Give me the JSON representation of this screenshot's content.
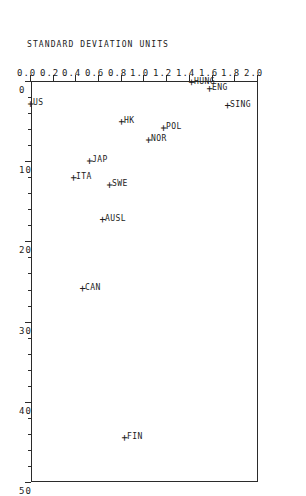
{
  "chart_data": {
    "type": "scatter",
    "title": "",
    "subtitle": "",
    "xlabel": "",
    "ylabel": "STANDARD DEVIATION UNITS",
    "xlim": [
      0,
      50
    ],
    "ylim": [
      0.0,
      2.0
    ],
    "grid": false,
    "legend": "none",
    "orientation": "rotated-90-clockwise",
    "marker": "+",
    "x_ticks": [
      0,
      10,
      20,
      30,
      40,
      50
    ],
    "x_tick_labels": [
      "0",
      "10",
      "20",
      "30",
      "40",
      "50"
    ],
    "x_minor_tick_step": 2,
    "y_ticks": [
      0.0,
      0.2,
      0.4,
      0.6,
      0.8,
      1.0,
      1.2,
      1.4,
      1.6,
      1.8,
      2.0
    ],
    "y_tick_labels": [
      "0.0",
      "0.2",
      "0.4",
      "0.6",
      "0.8",
      "1.0",
      "1.2",
      "1.4",
      "1.6",
      "1.8",
      "2.0"
    ],
    "points": [
      {
        "label": "FIN",
        "x": 44.5,
        "y": 0.83,
        "label_pos": "left"
      },
      {
        "label": "CAN",
        "x": 25.9,
        "y": 0.46,
        "label_pos": "left"
      },
      {
        "label": "AUSL",
        "x": 17.3,
        "y": 0.63,
        "label_pos": "left"
      },
      {
        "label": "SWE",
        "x": 13.0,
        "y": 0.7,
        "label_pos": "left"
      },
      {
        "label": "ITA",
        "x": 12.1,
        "y": 0.38,
        "label_pos": "left"
      },
      {
        "label": "JAP",
        "x": 10.0,
        "y": 0.52,
        "label_pos": "left"
      },
      {
        "label": "NOR",
        "x": 7.4,
        "y": 1.04,
        "label_pos": "left"
      },
      {
        "label": "POL",
        "x": 5.9,
        "y": 1.17,
        "label_pos": "left"
      },
      {
        "label": "HK",
        "x": 5.1,
        "y": 0.8,
        "label_pos": "left"
      },
      {
        "label": "SING",
        "x": 3.1,
        "y": 1.74,
        "label_pos": "left"
      },
      {
        "label": "US",
        "x": 2.9,
        "y": 0.0,
        "label_pos": "left"
      },
      {
        "label": "ENG",
        "x": 1.0,
        "y": 1.58,
        "label_pos": "left"
      },
      {
        "label": "HUNG",
        "x": 0.2,
        "y": 1.42,
        "label_pos": "left"
      }
    ]
  }
}
